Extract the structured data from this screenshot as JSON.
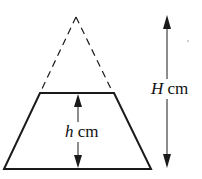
{
  "diagram": {
    "labels": {
      "total_height_var": "H",
      "total_height_unit": "cm",
      "frustum_height_var": "h",
      "frustum_height_unit": "cm"
    },
    "colors": {
      "stroke": "#1a1a1a",
      "background": "#ffffff"
    }
  }
}
